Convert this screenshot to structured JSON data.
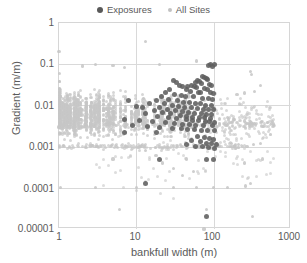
{
  "chart_data": {
    "type": "scatter",
    "title": "",
    "xlabel": "bankfull width (m)",
    "ylabel": "Gradient (m/m)",
    "xscale": "log",
    "yscale": "log",
    "xlim": [
      1,
      1000
    ],
    "ylim": [
      1e-05,
      1
    ],
    "xticks": [
      "1",
      "10",
      "100",
      "1000"
    ],
    "yticks": [
      "1",
      "0.1",
      "0.01",
      "0.001",
      "0.0001",
      "0.00001"
    ],
    "grid": true,
    "legend_position": "top-center",
    "series": [
      {
        "name": "Exposures",
        "color": "#5e5e5e",
        "marker": "circle",
        "marker_size": 5,
        "points": [
          [
            92,
            0.1
          ],
          [
            101,
            0.1
          ],
          [
            86,
            0.095
          ],
          [
            97,
            0.088
          ],
          [
            71,
            0.05
          ],
          [
            76,
            0.047
          ],
          [
            80,
            0.044
          ],
          [
            84,
            0.043
          ],
          [
            62,
            0.04
          ],
          [
            66,
            0.038
          ],
          [
            58,
            0.036
          ],
          [
            70,
            0.034
          ],
          [
            88,
            0.033
          ],
          [
            94,
            0.031
          ],
          [
            52,
            0.03
          ],
          [
            56,
            0.029
          ],
          [
            46,
            0.028
          ],
          [
            60,
            0.027
          ],
          [
            75,
            0.026
          ],
          [
            82,
            0.025
          ],
          [
            30,
            0.04
          ],
          [
            33,
            0.035
          ],
          [
            36,
            0.03
          ],
          [
            40,
            0.028
          ],
          [
            27,
            0.025
          ],
          [
            44,
            0.024
          ],
          [
            50,
            0.022
          ],
          [
            63,
            0.021
          ],
          [
            68,
            0.02
          ],
          [
            90,
            0.02
          ],
          [
            100,
            0.019
          ],
          [
            24,
            0.02
          ],
          [
            31,
            0.018
          ],
          [
            38,
            0.017
          ],
          [
            43,
            0.016
          ],
          [
            55,
            0.016
          ],
          [
            72,
            0.015
          ],
          [
            85,
            0.015
          ],
          [
            96,
            0.014
          ],
          [
            21,
            0.016
          ],
          [
            26,
            0.014
          ],
          [
            34,
            0.013
          ],
          [
            41,
            0.012
          ],
          [
            48,
            0.012
          ],
          [
            58,
            0.011
          ],
          [
            67,
            0.011
          ],
          [
            78,
            0.01
          ],
          [
            93,
            0.01
          ],
          [
            18,
            0.013
          ],
          [
            23,
            0.011
          ],
          [
            29,
            0.01
          ],
          [
            35,
            0.0095
          ],
          [
            42,
            0.009
          ],
          [
            51,
            0.0088
          ],
          [
            61,
            0.0085
          ],
          [
            74,
            0.008
          ],
          [
            87,
            0.008
          ],
          [
            99,
            0.0078
          ],
          [
            15,
            0.011
          ],
          [
            20,
            0.009
          ],
          [
            25,
            0.008
          ],
          [
            32,
            0.0075
          ],
          [
            39,
            0.007
          ],
          [
            47,
            0.0068
          ],
          [
            57,
            0.0065
          ],
          [
            69,
            0.0062
          ],
          [
            81,
            0.006
          ],
          [
            95,
            0.006
          ],
          [
            12,
            0.009
          ],
          [
            17,
            0.0075
          ],
          [
            22,
            0.0068
          ],
          [
            28,
            0.0062
          ],
          [
            37,
            0.0058
          ],
          [
            45,
            0.0055
          ],
          [
            54,
            0.0052
          ],
          [
            65,
            0.005
          ],
          [
            77,
            0.005
          ],
          [
            91,
            0.0048
          ],
          [
            8,
            0.013
          ],
          [
            10,
            0.0095
          ],
          [
            13,
            0.0065
          ],
          [
            19,
            0.0055
          ],
          [
            26,
            0.005
          ],
          [
            33,
            0.0048
          ],
          [
            44,
            0.0045
          ],
          [
            53,
            0.0043
          ],
          [
            64,
            0.0042
          ],
          [
            79,
            0.004
          ],
          [
            89,
            0.004
          ],
          [
            103,
            0.0038
          ],
          [
            7,
            0.0045
          ],
          [
            11,
            0.0042
          ],
          [
            16,
            0.004
          ],
          [
            24,
            0.0038
          ],
          [
            31,
            0.0036
          ],
          [
            40,
            0.0035
          ],
          [
            49,
            0.0034
          ],
          [
            59,
            0.0033
          ],
          [
            73,
            0.0032
          ],
          [
            98,
            0.0032
          ],
          [
            9,
            0.0032
          ],
          [
            14,
            0.003
          ],
          [
            20,
            0.0029
          ],
          [
            29,
            0.0028
          ],
          [
            38,
            0.0027
          ],
          [
            46,
            0.0026
          ],
          [
            56,
            0.0026
          ],
          [
            70,
            0.0025
          ],
          [
            83,
            0.0025
          ],
          [
            104,
            0.0025
          ],
          [
            62,
            0.0018
          ],
          [
            75,
            0.0017
          ],
          [
            88,
            0.0016
          ],
          [
            100,
            0.0015
          ],
          [
            52,
            0.0014
          ],
          [
            67,
            0.0013
          ],
          [
            80,
            0.0012
          ],
          [
            95,
            0.0012
          ],
          [
            108,
            0.0011
          ],
          [
            45,
            0.0011
          ],
          [
            58,
            0.001
          ],
          [
            72,
            0.001
          ],
          [
            86,
            0.00095
          ],
          [
            102,
            0.0009
          ],
          [
            18,
            0.0022
          ],
          [
            7,
            0.0022
          ],
          [
            20,
            0.0005
          ],
          [
            81,
            0.0005
          ],
          [
            99,
            0.0005
          ],
          [
            13,
            0.00013
          ],
          [
            80,
            2e-05
          ]
        ]
      },
      {
        "name": "All Sites",
        "color": "#c6c6c6",
        "marker": "circle",
        "marker_size": 3,
        "note": "Large dense cloud of several thousand river survey sites spanning bankfull widths 1-600 m and gradients 1e-5 to 0.2, concentrated between 0.001 and 0.05",
        "points": [
          [
            1,
            0.2
          ],
          [
            1,
            0.003
          ],
          [
            1.05,
            0.0001
          ],
          [
            2,
            0.09
          ],
          [
            3,
            0.1
          ],
          [
            5,
            0.095
          ],
          [
            7,
            0.085
          ],
          [
            13,
            0.35
          ],
          [
            20,
            0.1
          ],
          [
            60,
            0.12
          ],
          [
            90,
            0.1
          ],
          [
            105,
            0.1
          ],
          [
            300,
            0.065
          ],
          [
            305,
            0.055
          ],
          [
            400,
            0.03
          ],
          [
            340,
            0.022
          ],
          [
            250,
            0.02
          ],
          [
            200,
            0.018
          ],
          [
            420,
            0.004
          ],
          [
            500,
            0.0038
          ],
          [
            560,
            0.0036
          ],
          [
            600,
            0.0035
          ],
          [
            300,
            0.004
          ],
          [
            250,
            0.0042
          ],
          [
            180,
            0.0045
          ],
          [
            150,
            0.005
          ],
          [
            120,
            0.0048
          ],
          [
            400,
            0.0012
          ],
          [
            330,
            0.0011
          ],
          [
            270,
            0.001
          ],
          [
            210,
            0.0011
          ],
          [
            170,
            0.0012
          ],
          [
            430,
            0.0005
          ],
          [
            250,
            0.0004
          ],
          [
            300,
            0.00013
          ],
          [
            260,
            0.00011
          ],
          [
            150,
            0.0001
          ],
          [
            100,
            0.0001
          ],
          [
            60,
            0.0001
          ],
          [
            30,
            0.0001
          ],
          [
            10,
            0.0001
          ],
          [
            3,
            0.0001
          ],
          [
            80,
            3e-05
          ],
          [
            6,
            3e-05
          ],
          [
            320,
            2e-05
          ],
          [
            75,
            1e-05
          ],
          [
            40,
            0.0002
          ],
          [
            55,
            0.00025
          ],
          [
            30,
            0.0003
          ],
          [
            22,
            0.0004
          ],
          [
            45,
            0.0005
          ],
          [
            18,
            0.0006
          ],
          [
            13,
            0.0008
          ],
          [
            5,
            0.0005
          ]
        ]
      }
    ]
  },
  "legend": {
    "entries": [
      {
        "label": "Exposures",
        "color": "#595959"
      },
      {
        "label": "All Sites",
        "color": "#c2c2c2"
      }
    ]
  },
  "axes": {
    "y": {
      "label": "Gradient (m/m)",
      "ticks": [
        "1",
        "0.1",
        "0.01",
        "0.001",
        "0.0001",
        "0.00001"
      ]
    },
    "x": {
      "label": "bankfull width (m)",
      "ticks": [
        "1",
        "10",
        "100",
        "1000"
      ]
    }
  }
}
